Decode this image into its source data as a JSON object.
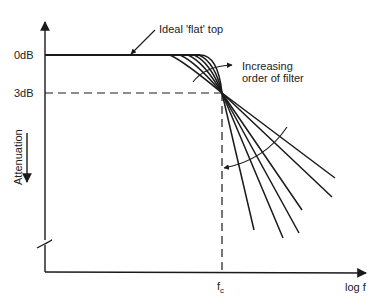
{
  "diagram": {
    "type": "filter-response",
    "labels": {
      "zero_db": "0dB",
      "three_db": "3dB",
      "y_axis": "Attenuation",
      "x_axis": "log f",
      "cutoff": "f",
      "cutoff_sub": "c",
      "ideal_top": "Ideal 'flat' top",
      "increasing_order": "Increasing order of filter"
    },
    "colors": {
      "ink": "#1a1a1a",
      "background": "#ffffff"
    },
    "rolloff_lines": 6
  }
}
